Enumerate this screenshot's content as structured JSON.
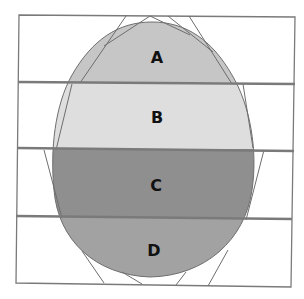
{
  "diagram": {
    "type": "egg-divided-into-horizontal-bands",
    "regions": [
      {
        "label": "A",
        "fill": "#c6c6c6"
      },
      {
        "label": "B",
        "fill": "#dedede"
      },
      {
        "label": "C",
        "fill": "#8f8f8f"
      },
      {
        "label": "D",
        "fill": "#a2a2a2"
      }
    ],
    "line_color": "#6e6e6e",
    "divider_color": "#7a7a7a"
  }
}
